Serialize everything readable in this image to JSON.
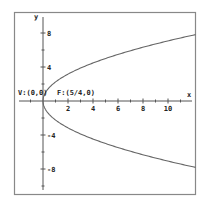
{
  "chart_data": {
    "type": "line",
    "title": "",
    "equation": "y^2 = 5x",
    "xlabel": "x",
    "ylabel": "y",
    "xlim": [
      -2,
      12.2
    ],
    "ylim": [
      -10.5,
      10
    ],
    "x_ticks": [
      2,
      4,
      6,
      8,
      10
    ],
    "x_tick_labels": [
      "2",
      "4",
      "6",
      "8",
      "10"
    ],
    "y_ticks": [
      8,
      4,
      -4,
      -8
    ],
    "y_tick_labels": [
      "8",
      "4",
      "-4",
      "-8"
    ],
    "grid": false,
    "annotations": [
      {
        "text": "V:(0,0)",
        "x": 0,
        "y": 0
      },
      {
        "text": "F:(5/4,0)",
        "x": 1.25,
        "y": 0
      }
    ],
    "series": [
      {
        "name": "upper branch",
        "x": [
          0,
          0.5,
          1,
          2,
          4,
          6,
          8,
          10,
          12.2
        ],
        "y": [
          0,
          1.58,
          2.24,
          3.16,
          4.47,
          5.48,
          6.32,
          7.07,
          7.81
        ]
      },
      {
        "name": "lower branch",
        "x": [
          0,
          0.5,
          1,
          2,
          4,
          6,
          8,
          10,
          12.2
        ],
        "y": [
          0,
          -1.58,
          -2.24,
          -3.16,
          -4.47,
          -5.48,
          -6.32,
          -7.07,
          -7.81
        ]
      }
    ],
    "colors": {
      "frame": "#888888",
      "axes": "#555555",
      "curve": "#666666",
      "text": "#222222"
    }
  }
}
